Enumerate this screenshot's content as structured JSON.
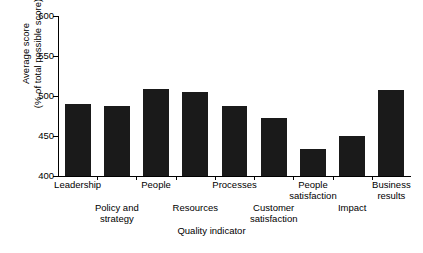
{
  "chart_data": {
    "type": "bar",
    "title": "",
    "subtitle": "",
    "xlabel": "Quality indicator",
    "ylabel": "Average score (% of total possible score)",
    "ylabel_line1": "Average score",
    "ylabel_line2": "(% of total possible score)",
    "categories": [
      "Leadership",
      "Policy and strategy",
      "People",
      "Resources",
      "Processes",
      "Customer satisfaction",
      "People satisfaction",
      "Impact",
      "Business results"
    ],
    "category_labels": [
      {
        "line1": "Leadership",
        "line2": "",
        "row": "top"
      },
      {
        "line1": "Policy and",
        "line2": "strategy",
        "row": "bottom"
      },
      {
        "line1": "People",
        "line2": "",
        "row": "top"
      },
      {
        "line1": "Resources",
        "line2": "",
        "row": "bottom"
      },
      {
        "line1": "Processes",
        "line2": "",
        "row": "top"
      },
      {
        "line1": "Customer",
        "line2": "satisfaction",
        "row": "bottom"
      },
      {
        "line1": "People",
        "line2": "satisfaction",
        "row": "top"
      },
      {
        "line1": "Impact",
        "line2": "",
        "row": "bottom"
      },
      {
        "line1": "Business",
        "line2": "results",
        "row": "top"
      }
    ],
    "values": [
      490,
      488,
      509,
      505,
      488,
      472,
      434,
      450,
      508
    ],
    "ylim": [
      400,
      600
    ],
    "yticks": [
      400,
      450,
      500,
      550,
      600
    ],
    "ytick_labels": [
      "400",
      "450",
      "500",
      "550",
      "600"
    ],
    "grid": false,
    "legend": false,
    "bar_color": "#1a1a1a",
    "axis_color": "#000000",
    "background_color": "#ffffff"
  }
}
